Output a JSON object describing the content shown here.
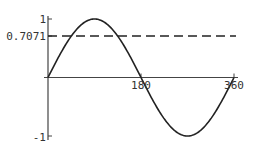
{
  "chart_data": {
    "type": "line",
    "title": "",
    "xlabel": "",
    "ylabel": "",
    "xlim": [
      0,
      360
    ],
    "ylim": [
      -1,
      1
    ],
    "grid": false,
    "legend": null,
    "x_ticks": [
      {
        "value": 180,
        "label": "180"
      },
      {
        "value": 360,
        "label": "360"
      }
    ],
    "y_ticks": [
      {
        "value": 1,
        "label": "1"
      },
      {
        "value": 0.7071,
        "label": "0.7071"
      },
      {
        "value": -1,
        "label": "-1"
      }
    ],
    "series": [
      {
        "name": "sin(x)",
        "style": "solid",
        "function": "sin(x degrees)",
        "x": [
          0,
          45,
          90,
          135,
          180,
          225,
          270,
          315,
          360
        ],
        "values": [
          0,
          0.7071,
          1,
          0.7071,
          0,
          -0.7071,
          -1,
          -0.7071,
          0
        ]
      },
      {
        "name": "y = 0.7071",
        "style": "dashed",
        "x": [
          0,
          360
        ],
        "values": [
          0.7071,
          0.7071
        ]
      }
    ]
  },
  "labels": {
    "y_top": "1",
    "y_ref": "0.7071",
    "y_bottom": "-1",
    "x_mid": "180",
    "x_end": "360"
  }
}
